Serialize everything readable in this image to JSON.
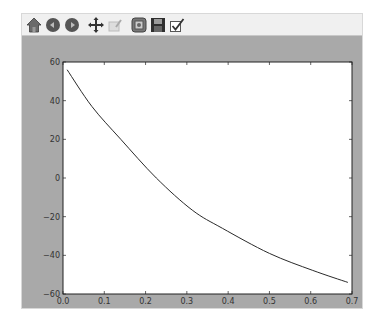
{
  "toolbar": {
    "buttons": [
      {
        "name": "home",
        "icon": "home-icon"
      },
      {
        "name": "back",
        "icon": "back-arrow-icon"
      },
      {
        "name": "forward",
        "icon": "forward-arrow-icon"
      },
      {
        "name": "pan",
        "icon": "move-icon"
      },
      {
        "name": "zoom",
        "icon": "zoom-rect-icon"
      },
      {
        "name": "subplots",
        "icon": "subplots-config-icon"
      },
      {
        "name": "save",
        "icon": "floppy-save-icon"
      },
      {
        "name": "edit",
        "icon": "checkbox-edit-icon"
      }
    ]
  },
  "chart_data": {
    "type": "line",
    "title": "",
    "xlabel": "",
    "ylabel": "",
    "xlim": [
      0.0,
      0.7
    ],
    "ylim": [
      -60,
      60
    ],
    "xticks": [
      "0.0",
      "0.1",
      "0.2",
      "0.3",
      "0.4",
      "0.5",
      "0.6",
      "0.7"
    ],
    "yticks": [
      "60",
      "40",
      "20",
      "0",
      "−20",
      "−40",
      "−60"
    ],
    "grid": false,
    "legend": null,
    "series": [
      {
        "name": "line",
        "color": "#2a2a2a",
        "x": [
          0.01,
          0.07,
          0.14,
          0.226,
          0.313,
          0.386,
          0.5,
          0.605,
          0.69
        ],
        "y": [
          56,
          37,
          20,
          0,
          -16.6,
          -26,
          -39,
          -47.8,
          -54
        ]
      }
    ]
  },
  "colors": {
    "window_bg": "#a9a9a9",
    "plot_bg": "#ffffff",
    "toolbar_bg": "#f0f0f0",
    "line": "#2a2a2a"
  }
}
